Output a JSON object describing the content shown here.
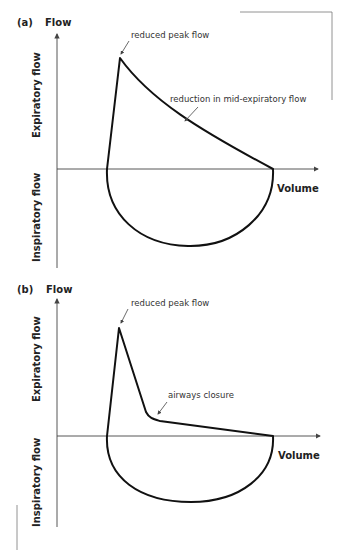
{
  "panels": [
    {
      "id": "a",
      "label": "(a)",
      "y_axis_title": "Flow",
      "x_axis_title": "Volume",
      "upper_axis_label": "Expiratory flow",
      "lower_axis_label": "Inspiratory flow",
      "annotations": [
        "reduced peak flow",
        "reduction in mid-expiratory flow"
      ]
    },
    {
      "id": "b",
      "label": "(b)",
      "y_axis_title": "Flow",
      "x_axis_title": "Volume",
      "upper_axis_label": "Expiratory flow",
      "lower_axis_label": "Inspiratory flow",
      "annotations": [
        "reduced peak flow",
        "airways closure"
      ]
    }
  ],
  "colors": {
    "curve": "#111111",
    "axis": "#444444",
    "text": "#222222"
  }
}
